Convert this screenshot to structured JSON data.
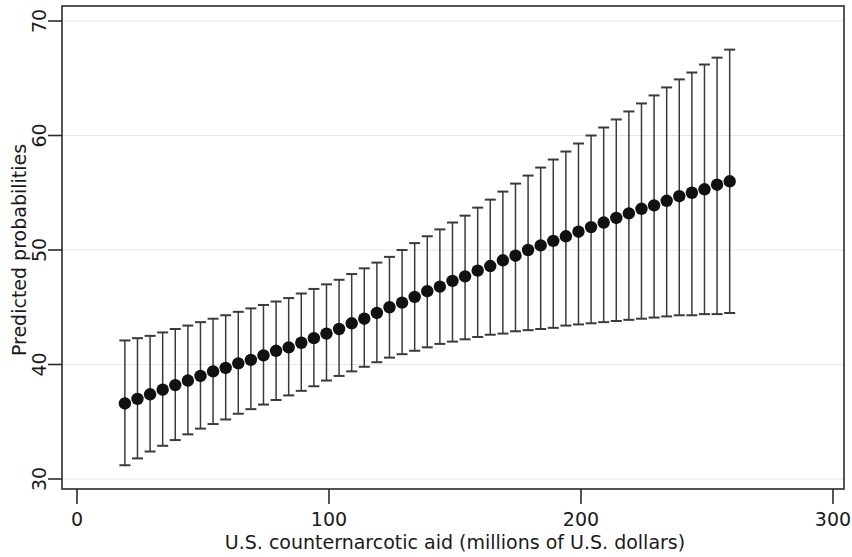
{
  "chart_data": {
    "type": "line",
    "title": "",
    "subtitle": "",
    "xlabel": "U.S. counternarcotic aid (millions of U.S. dollars)",
    "ylabel": "Predicted probabilities",
    "xlim": [
      0,
      300
    ],
    "ylim": [
      30,
      70
    ],
    "xticks": [
      0,
      100,
      200,
      300
    ],
    "xtick_labels": [
      "0",
      "100",
      "200",
      "300"
    ],
    "yticks": [
      30,
      40,
      50,
      60,
      70
    ],
    "ytick_labels": [
      "30",
      "40",
      "50",
      "60",
      "70"
    ],
    "grid": "horizontal",
    "grid_color": "#e6e6e6",
    "marker": "filled-circle",
    "marker_color": "#111111",
    "errorbar_style": "capped-vertical",
    "errorbar_color": "#3a3a3a",
    "legend": null,
    "series": [
      {
        "name": "Predicted probability with 95% CI",
        "x": [
          19,
          24,
          29,
          34,
          39,
          44,
          49,
          54,
          59,
          64,
          69,
          74,
          79,
          84,
          89,
          94,
          99,
          104,
          109,
          114,
          119,
          124,
          129,
          134,
          139,
          144,
          149,
          154,
          159,
          164,
          169,
          174,
          179,
          184,
          189,
          194,
          199,
          204,
          209,
          214,
          219,
          224,
          229,
          234,
          239,
          244,
          249,
          254,
          259
        ],
        "values": [
          36.6,
          37.0,
          37.4,
          37.8,
          38.2,
          38.6,
          39.0,
          39.4,
          39.7,
          40.1,
          40.4,
          40.8,
          41.2,
          41.5,
          41.9,
          42.3,
          42.7,
          43.1,
          43.6,
          44.0,
          44.5,
          45.0,
          45.4,
          45.9,
          46.4,
          46.8,
          47.3,
          47.7,
          48.2,
          48.6,
          49.1,
          49.5,
          50.0,
          50.4,
          50.8,
          51.2,
          51.6,
          52.0,
          52.4,
          52.8,
          53.2,
          53.6,
          53.9,
          54.3,
          54.7,
          55.0,
          55.3,
          55.7,
          56.0
        ],
        "ci_lower": [
          31.2,
          31.8,
          32.4,
          32.9,
          33.4,
          33.9,
          34.4,
          34.8,
          35.2,
          35.7,
          36.1,
          36.5,
          36.9,
          37.3,
          37.7,
          38.1,
          38.6,
          39.0,
          39.4,
          39.8,
          40.2,
          40.6,
          40.9,
          41.2,
          41.5,
          41.8,
          42.0,
          42.2,
          42.4,
          42.6,
          42.7,
          42.9,
          43.0,
          43.1,
          43.2,
          43.4,
          43.5,
          43.6,
          43.7,
          43.8,
          43.9,
          44.0,
          44.1,
          44.2,
          44.3,
          44.3,
          44.4,
          44.4,
          44.5
        ],
        "ci_upper": [
          42.1,
          42.3,
          42.5,
          42.8,
          43.1,
          43.4,
          43.7,
          44.0,
          44.3,
          44.6,
          44.9,
          45.2,
          45.5,
          45.8,
          46.2,
          46.6,
          47.0,
          47.4,
          47.9,
          48.4,
          48.9,
          49.4,
          50.0,
          50.6,
          51.2,
          51.8,
          52.4,
          53.0,
          53.7,
          54.4,
          55.1,
          55.8,
          56.5,
          57.2,
          57.9,
          58.6,
          59.3,
          60.0,
          60.7,
          61.4,
          62.1,
          62.8,
          63.5,
          64.2,
          64.9,
          65.5,
          66.2,
          66.8,
          67.5
        ]
      }
    ]
  }
}
